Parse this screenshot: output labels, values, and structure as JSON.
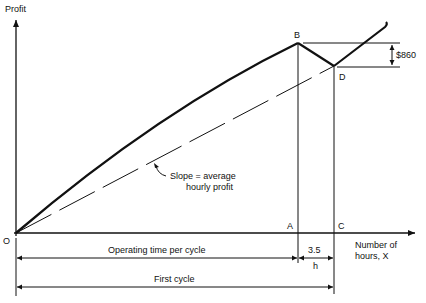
{
  "diagram": {
    "type": "profit-vs-hours cycle diagram",
    "y_axis_label": "Profit",
    "x_axis_label_line1": "Number of",
    "x_axis_label_line2": "hours, X",
    "origin_label": "O",
    "points": {
      "A": "A",
      "B": "B",
      "C": "C",
      "D": "D"
    },
    "profit_drop_label": "$860",
    "slope_annotation_line1": "Slope = average",
    "slope_annotation_line2": "hourly profit",
    "downtime_value": "3.5",
    "downtime_symbol": "h",
    "operating_time_label": "Operating time per cycle",
    "first_cycle_label": "First cycle",
    "colors": {
      "ink": "#111111",
      "background": "#ffffff"
    }
  }
}
